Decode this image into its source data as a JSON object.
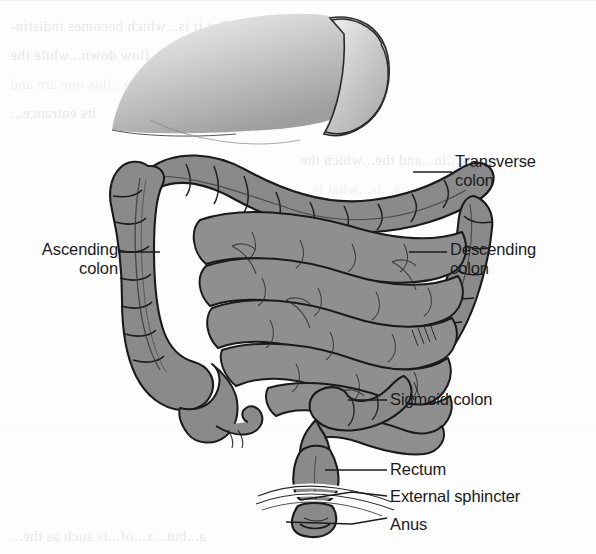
{
  "figure": {
    "medium": "scanned textbook line drawing, grayscale",
    "colors": {
      "paper": "#fdfdfd",
      "colon_fill": "#8a8a8a",
      "small_intestine_fill": "#8f8f8f",
      "stomach_fill": "#c9c9c9",
      "outline": "#1a1a1a",
      "label_text": "#1b1b1b",
      "leader_line": "#1b1b1b"
    }
  },
  "labels": [
    {
      "id": "transverse-colon",
      "text": "Transverse\ncolon",
      "align": "left",
      "x": 455,
      "y": 152
    },
    {
      "id": "ascending-colon",
      "text": "Ascending\ncolon",
      "align": "right",
      "x": 28,
      "y": 240
    },
    {
      "id": "descending-colon",
      "text": "Descending\ncolon",
      "align": "left",
      "x": 450,
      "y": 240
    },
    {
      "id": "sigmoid-colon",
      "text": "Sigmoid colon",
      "align": "left",
      "x": 390,
      "y": 390
    },
    {
      "id": "rectum",
      "text": "Rectum",
      "align": "left",
      "x": 390,
      "y": 458
    },
    {
      "id": "external-sphincter",
      "text": "External sphincter",
      "align": "left",
      "x": 390,
      "y": 486
    },
    {
      "id": "anus",
      "text": "Anus",
      "align": "left",
      "x": 390,
      "y": 514
    }
  ],
  "ghost_text": {
    "note": "faint mirrored bleed-through text from the reverse printed page",
    "lines": [
      {
        "text": "as enduring. But it is...which becomes indistin-",
        "x": 10,
        "y": 18,
        "size": 15
      },
      {
        "text": "It is as impossible to count...flow down...while the",
        "x": 10,
        "y": 47,
        "size": 15
      },
      {
        "text": "when reaching the...in a...this one are and",
        "x": 10,
        "y": 76,
        "size": 15
      },
      {
        "text": "its entrance...",
        "x": 10,
        "y": 105,
        "size": 15
      },
      {
        "text": "of the...in...and the...which the",
        "x": 300,
        "y": 152,
        "size": 15
      },
      {
        "text": "is that...a...is...what is...",
        "x": 300,
        "y": 181,
        "size": 15
      },
      {
        "text": "the...colon...and...",
        "x": 300,
        "y": 210,
        "size": 15
      },
      {
        "text": "as...were...the...",
        "x": 300,
        "y": 239,
        "size": 15
      },
      {
        "text": "than...in...the...",
        "x": 300,
        "y": 297,
        "size": 15
      },
      {
        "text": "pha...that...is...the...",
        "x": 300,
        "y": 326,
        "size": 15
      },
      {
        "text": "we...separate...it...the...",
        "x": 300,
        "y": 355,
        "size": 15
      },
      {
        "text": "for...this...part...",
        "x": 300,
        "y": 384,
        "size": 15
      },
      {
        "text": "a...but...x...of...is such as the...",
        "x": 10,
        "y": 528,
        "size": 15
      }
    ]
  }
}
